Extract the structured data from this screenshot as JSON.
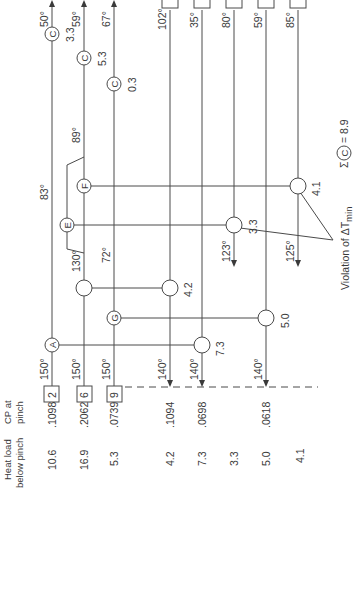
{
  "figure": {
    "orientation": "rotated 90 degrees clockwise",
    "header": {
      "heat_load_label": "Heat load below pinch",
      "heat_load_line1": "Heat load",
      "heat_load_line2": "below pinch",
      "cp_label_line1": "CP at",
      "cp_label_line2": "pinch"
    },
    "streams_with_boxes": [
      {
        "id": "2",
        "heat_load": "10.6",
        "cp": ".1098",
        "start_temp": "150°",
        "end_temp": "50°"
      },
      {
        "id": "6",
        "heat_load": "16.9",
        "cp": ".2062",
        "start_temp": "150°",
        "end_temp": "59°"
      },
      {
        "id": "9",
        "heat_load": "5.3",
        "cp": ".0739",
        "start_temp": "150°",
        "end_temp": "67°"
      }
    ],
    "other_streams": [
      {
        "heat_load": "4.2",
        "cp": ".1094",
        "pinch_temp": "140°",
        "far_temp": "102°"
      },
      {
        "heat_load": "7.3",
        "cp": ".0698",
        "pinch_temp": "140°",
        "far_temp": "35°"
      },
      {
        "heat_load": "3.3",
        "cp": "",
        "pinch_temp": "123°",
        "far_temp": "80°"
      },
      {
        "heat_load": "5.0",
        "cp": ".0618",
        "pinch_temp": "140°",
        "far_temp": "59°"
      },
      {
        "heat_load": "4.1",
        "cp": "",
        "pinch_temp": "125°",
        "far_temp": "85°"
      }
    ],
    "exchangers": [
      {
        "label": "A",
        "duty": "7.3"
      },
      {
        "label": "G",
        "duty": "5.0"
      },
      {
        "label": "",
        "duty": "4.2"
      },
      {
        "label": "E",
        "duty": "3.3"
      },
      {
        "label": "F",
        "duty": "4.1"
      }
    ],
    "coolers": [
      {
        "label": "C",
        "duty": "3.3"
      },
      {
        "label": "C",
        "duty": "5.3"
      },
      {
        "label": "C",
        "duty": "0.3"
      }
    ],
    "split_temps": {
      "before_split": "130°",
      "after_split": "89°",
      "stream2_mid": "83°",
      "stream9_mid": "72°"
    },
    "annotations": {
      "violation": "Violation of ΔT",
      "violation_sub": "min",
      "sigma": "Σ",
      "sigma_circle": "C",
      "sigma_value": "= 8.9"
    }
  }
}
